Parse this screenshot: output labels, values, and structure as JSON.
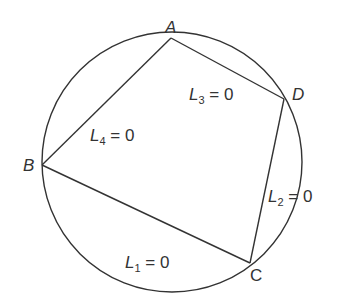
{
  "diagram": {
    "circle": {
      "cx": 172,
      "cy": 162,
      "r": 130
    },
    "points": [
      {
        "name": "A",
        "x": 171,
        "y": 38,
        "lx": 165,
        "ly": 33
      },
      {
        "name": "B",
        "x": 42,
        "y": 165,
        "lx": 23,
        "ly": 171
      },
      {
        "name": "C",
        "x": 250,
        "y": 263,
        "lx": 250,
        "ly": 280
      },
      {
        "name": "D",
        "x": 284,
        "y": 99,
        "lx": 292,
        "ly": 99
      }
    ],
    "lines": [
      {
        "label": "L",
        "sub": "1",
        "eq": " = 0",
        "from": "B",
        "to": "C",
        "x": 125,
        "y": 268
      },
      {
        "label": "L",
        "sub": "2",
        "eq": " = 0",
        "from": "C",
        "to": "D",
        "x": 268,
        "y": 202
      },
      {
        "label": "L",
        "sub": "3",
        "eq": " = 0",
        "from": "D",
        "to": "A",
        "x": 189,
        "y": 100
      },
      {
        "label": "L",
        "sub": "4",
        "eq": " = 0",
        "from": "A",
        "to": "B",
        "x": 90,
        "y": 141
      }
    ]
  }
}
